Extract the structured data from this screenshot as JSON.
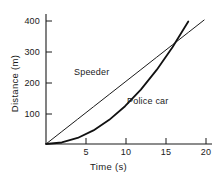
{
  "chart_data": {
    "type": "line",
    "title": "",
    "xlabel": "Time  (s)",
    "ylabel": "Distance (m)",
    "xlim": [
      0,
      21
    ],
    "ylim": [
      0,
      430
    ],
    "xticks": [
      5,
      10,
      15,
      20
    ],
    "xtick_labels": [
      "5",
      "10",
      "15",
      "20"
    ],
    "yticks": [
      100,
      200,
      300,
      400
    ],
    "ytick_labels": [
      "100",
      "200",
      "300",
      "400"
    ],
    "grid": false,
    "legend_position": "inline-annotations",
    "annotations": [
      {
        "text": "Speeder",
        "x": 8.5,
        "y": 250
      },
      {
        "text": "Police car",
        "x": 15.0,
        "y": 155
      }
    ],
    "series": [
      {
        "name": "Speeder",
        "kind": "line",
        "description": "constant velocity, straight line through origin",
        "color": "#1a1a1a",
        "linewidth": 1,
        "x": [
          0,
          2,
          4,
          6,
          8,
          10,
          12,
          14,
          16,
          18,
          20
        ],
        "y": [
          0,
          41,
          82,
          123,
          164,
          205,
          246,
          287,
          328,
          369,
          410
        ]
      },
      {
        "name": "Police car",
        "kind": "curve",
        "description": "constant acceleration from rest, parabola",
        "color": "#111111",
        "linewidth": 1.8,
        "x": [
          0,
          2,
          4,
          6,
          8,
          10,
          12,
          14,
          16,
          18
        ],
        "y": [
          0,
          5,
          20,
          45,
          80,
          125,
          180,
          245,
          320,
          405
        ]
      }
    ],
    "intersection": {
      "x": 16.5,
      "y": 338
    }
  },
  "axis": {
    "y_tick_400": "400",
    "y_tick_300": "300",
    "y_tick_200": "200",
    "y_tick_100": "100",
    "x_tick_5": "5",
    "x_tick_10": "10",
    "x_tick_15": "15",
    "x_tick_20": "20",
    "ylabel_text": "Distance (m)",
    "xlabel_text": "Time  (s)"
  },
  "labels": {
    "speeder": "Speeder",
    "police_car": "Police car"
  },
  "colors": {
    "background": "#ffffff",
    "ink": "#1a1a1a"
  }
}
